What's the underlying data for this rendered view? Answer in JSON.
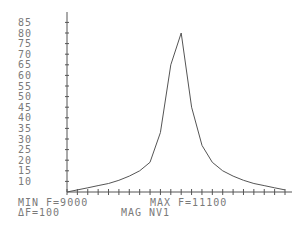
{
  "chart_data": {
    "type": "line",
    "title": "",
    "xlabel": "F",
    "ylabel": "MAG NV1",
    "x": [
      9000,
      9100,
      9200,
      9300,
      9400,
      9500,
      9600,
      9700,
      9800,
      9900,
      10000,
      10100,
      10200,
      10300,
      10400,
      10500,
      10600,
      10700,
      10800,
      10900,
      11000,
      11100
    ],
    "values": [
      5,
      6,
      7,
      8,
      9,
      10.5,
      12.5,
      15,
      19,
      33,
      65,
      80,
      45,
      27,
      19,
      15,
      12.5,
      10.5,
      9,
      8,
      7,
      6
    ],
    "yticks": [
      10,
      15,
      20,
      25,
      30,
      35,
      40,
      45,
      50,
      55,
      60,
      65,
      70,
      75,
      80,
      85
    ],
    "ylim": [
      5,
      90
    ],
    "xlim": [
      9000,
      11100
    ],
    "grid": false,
    "legend": null
  },
  "footer": {
    "min_label": "MIN F=9000",
    "max_label": "MAX F=11100",
    "delta_label": "ΔF=100",
    "mag_label": "MAG NV1"
  },
  "axis": {
    "y_labels": [
      "85",
      "80",
      "75",
      "70",
      "65",
      "60",
      "55",
      "50",
      "45",
      "40",
      "35",
      "30",
      "25",
      "20",
      "15",
      "10"
    ]
  },
  "colors": {
    "axis": "#555555",
    "line": "#555555",
    "text": "#7a7a7a"
  }
}
